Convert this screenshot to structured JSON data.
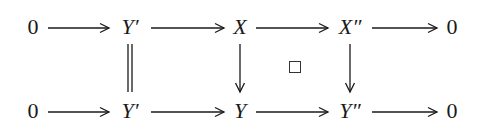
{
  "diagram": {
    "type": "commutative-diagram",
    "rows": [
      {
        "name": "top-row",
        "nodes": [
          {
            "id": "t0",
            "label": "0",
            "italic": false
          },
          {
            "id": "t1",
            "label": "Y′",
            "italic": true
          },
          {
            "id": "t2",
            "label": "X",
            "italic": true
          },
          {
            "id": "t3",
            "label": "X″",
            "italic": true
          },
          {
            "id": "t4",
            "label": "0",
            "italic": false
          }
        ]
      },
      {
        "name": "bottom-row",
        "nodes": [
          {
            "id": "b0",
            "label": "0",
            "italic": false
          },
          {
            "id": "b1",
            "label": "Y′",
            "italic": true
          },
          {
            "id": "b2",
            "label": "Y",
            "italic": true
          },
          {
            "id": "b3",
            "label": "Y″",
            "italic": true
          },
          {
            "id": "b4",
            "label": "0",
            "italic": false
          }
        ]
      }
    ],
    "edges": [
      {
        "from": "t0",
        "to": "t1",
        "style": "arrow"
      },
      {
        "from": "t1",
        "to": "t2",
        "style": "arrow"
      },
      {
        "from": "t2",
        "to": "t3",
        "style": "arrow"
      },
      {
        "from": "t3",
        "to": "t4",
        "style": "arrow"
      },
      {
        "from": "b0",
        "to": "b1",
        "style": "arrow"
      },
      {
        "from": "b1",
        "to": "b2",
        "style": "arrow"
      },
      {
        "from": "b2",
        "to": "b3",
        "style": "arrow"
      },
      {
        "from": "b3",
        "to": "b4",
        "style": "arrow"
      },
      {
        "from": "t1",
        "to": "b1",
        "style": "equality"
      },
      {
        "from": "t2",
        "to": "b2",
        "style": "arrow"
      },
      {
        "from": "t3",
        "to": "b3",
        "style": "arrow"
      }
    ],
    "square_marker": {
      "symbol": "□",
      "meaning": "pullback-square",
      "cell": [
        "t2",
        "t3",
        "b2",
        "b3"
      ]
    },
    "colors": {
      "ink": "#1a1a1a",
      "background": "#ffffff"
    }
  }
}
